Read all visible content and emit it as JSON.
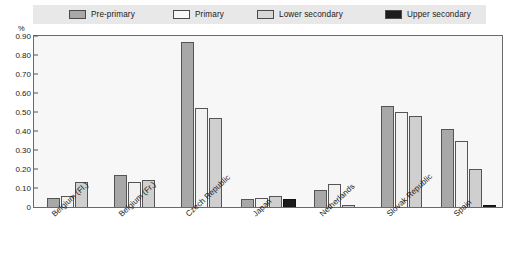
{
  "chart_data": {
    "type": "bar",
    "title": "",
    "xlabel": "",
    "ylabel": "%",
    "ylim": [
      0,
      0.9
    ],
    "grid": false,
    "legend_position": "top",
    "yticks": [
      "0.90",
      "0.80",
      "0.70",
      "0.60",
      "0.50",
      "0.40",
      "0.30",
      "0.20",
      "0.10",
      "0"
    ],
    "ytick_values": [
      0.9,
      0.8,
      0.7,
      0.6,
      0.5,
      0.4,
      0.3,
      0.2,
      0.1,
      0
    ],
    "categories": [
      "Belgium (Fl.)",
      "Belgium (Fr.)",
      "Czech Republic",
      "Japan",
      "Netherlands",
      "Slovak Republic",
      "Spain"
    ],
    "series": [
      {
        "name": "Pre-primary",
        "color": "#a8a8a8",
        "values": [
          0.05,
          0.17,
          0.87,
          0.04,
          0.09,
          0.53,
          0.41
        ]
      },
      {
        "name": "Primary",
        "color": "#f2f2f2",
        "values": [
          0.06,
          0.13,
          0.52,
          0.05,
          0.12,
          0.5,
          0.35
        ]
      },
      {
        "name": "Lower secondary",
        "color": "#cfcfcf",
        "values": [
          0.13,
          0.14,
          0.47,
          0.06,
          0.01,
          0.48,
          0.2
        ]
      },
      {
        "name": "Upper secondary",
        "color": "#1c1c1c",
        "values": [
          0,
          0,
          0,
          0.04,
          0,
          0,
          0.01
        ]
      }
    ]
  },
  "legend": {
    "items": [
      {
        "label": "Pre-primary",
        "color": "#a8a8a8"
      },
      {
        "label": "Primary",
        "color": "#f2f2f2"
      },
      {
        "label": "Lower secondary",
        "color": "#cfcfcf"
      },
      {
        "label": "Upper secondary",
        "color": "#1c1c1c"
      }
    ]
  },
  "axis": {
    "y_unit": "%"
  }
}
